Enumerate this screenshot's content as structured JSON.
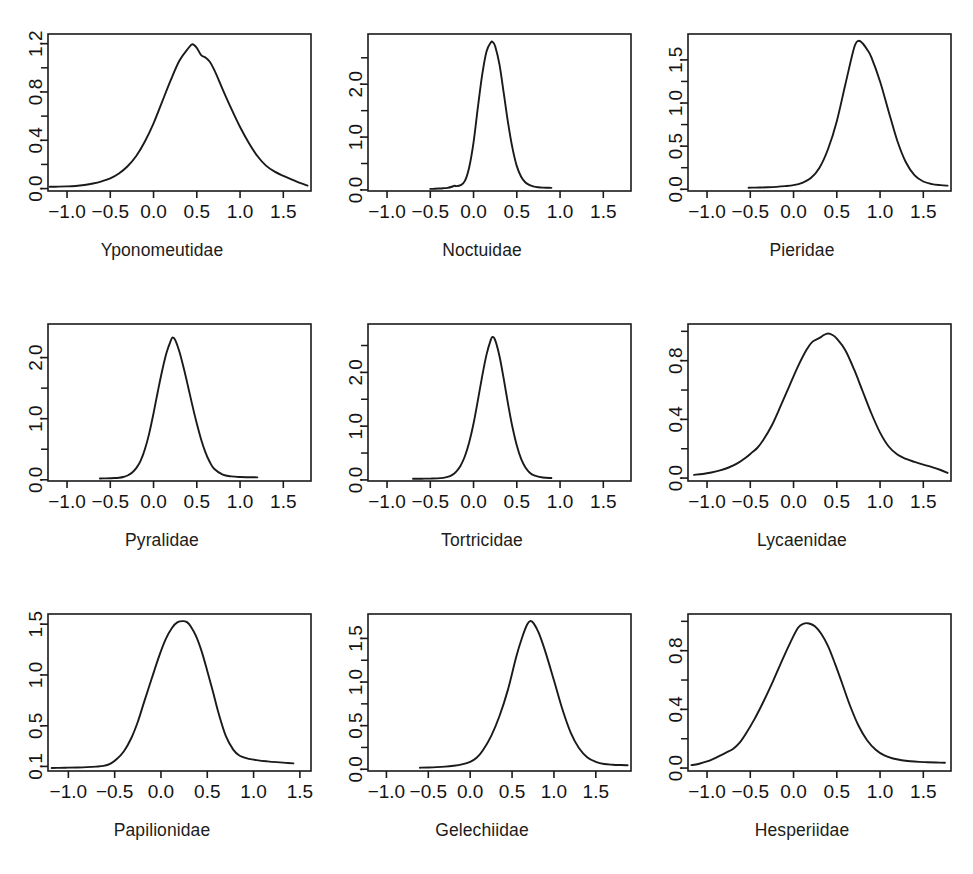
{
  "figure": {
    "background": "#ffffff",
    "line_color": "#1a1a1a",
    "axis_color": "#1a1a1a",
    "rows": 3,
    "cols": 3,
    "top_clipped_text": "·                                 ·"
  },
  "chart_data": [
    {
      "type": "line",
      "title": "Yponomeutidae",
      "xlabel": "",
      "ylabel": "",
      "xlim": [
        -1.22,
        1.82
      ],
      "ylim": [
        -0.02,
        1.28
      ],
      "xticks": [
        -1.0,
        -0.5,
        0.0,
        0.5,
        1.0,
        1.5
      ],
      "xticklabels": [
        "-1.0",
        "-0.5",
        "0.0",
        "0.5",
        "1.0",
        "1.5"
      ],
      "yticks": [
        0.0,
        0.4,
        0.8,
        1.2
      ],
      "yticklabels": [
        "0.0",
        "0.4",
        "0.8",
        "1.2"
      ],
      "yminor": [
        0.2,
        0.6,
        1.0
      ],
      "grid": false,
      "x": [
        -1.2,
        -1.1,
        -1.0,
        -0.9,
        -0.8,
        -0.7,
        -0.6,
        -0.5,
        -0.4,
        -0.3,
        -0.2,
        -0.1,
        0.0,
        0.1,
        0.2,
        0.3,
        0.4,
        0.45,
        0.5,
        0.55,
        0.6,
        0.65,
        0.7,
        0.75,
        0.8,
        0.9,
        1.0,
        1.1,
        1.2,
        1.3,
        1.4,
        1.5,
        1.6,
        1.7,
        1.78
      ],
      "y": [
        0.015,
        0.016,
        0.018,
        0.022,
        0.03,
        0.042,
        0.06,
        0.085,
        0.125,
        0.185,
        0.27,
        0.39,
        0.54,
        0.72,
        0.9,
        1.06,
        1.16,
        1.195,
        1.165,
        1.105,
        1.085,
        1.05,
        0.985,
        0.905,
        0.82,
        0.66,
        0.51,
        0.38,
        0.27,
        0.19,
        0.14,
        0.105,
        0.075,
        0.045,
        0.025
      ]
    },
    {
      "type": "line",
      "title": "Noctuidae",
      "xlabel": "",
      "ylabel": "",
      "xlim": [
        -1.22,
        1.82
      ],
      "ylim": [
        -0.02,
        2.95
      ],
      "xticks": [
        -1.0,
        -0.5,
        0.0,
        0.5,
        1.0,
        1.5
      ],
      "xticklabels": [
        "-1.0",
        "-0.5",
        "0.0",
        "0.5",
        "1.0",
        "1.5"
      ],
      "yticks": [
        0.0,
        1.0,
        2.0
      ],
      "yticklabels": [
        "0.0",
        "1.0",
        "2.0"
      ],
      "yminor": [
        0.5,
        1.5,
        2.5
      ],
      "grid": false,
      "x": [
        -0.5,
        -0.45,
        -0.4,
        -0.35,
        -0.3,
        -0.25,
        -0.22,
        -0.2,
        -0.15,
        -0.1,
        -0.05,
        0.0,
        0.05,
        0.1,
        0.15,
        0.2,
        0.22,
        0.25,
        0.3,
        0.35,
        0.4,
        0.45,
        0.5,
        0.55,
        0.6,
        0.65,
        0.7,
        0.75,
        0.8,
        0.85,
        0.9
      ],
      "y": [
        0.02,
        0.022,
        0.026,
        0.032,
        0.04,
        0.06,
        0.08,
        0.072,
        0.09,
        0.17,
        0.43,
        0.9,
        1.56,
        2.18,
        2.62,
        2.79,
        2.8,
        2.72,
        2.37,
        1.82,
        1.26,
        0.79,
        0.45,
        0.25,
        0.14,
        0.09,
        0.062,
        0.05,
        0.044,
        0.042,
        0.04
      ]
    },
    {
      "type": "line",
      "title": "Pieridae",
      "xlabel": "",
      "ylabel": "",
      "xlim": [
        -1.22,
        1.82
      ],
      "ylim": [
        -0.02,
        1.8
      ],
      "xticks": [
        -1.0,
        -0.5,
        0.0,
        0.5,
        1.0,
        1.5
      ],
      "xticklabels": [
        "-1.0",
        "-0.5",
        "0.0",
        "0.5",
        "1.0",
        "1.5"
      ],
      "yticks": [
        0.0,
        0.5,
        1.0,
        1.5
      ],
      "yticklabels": [
        "0.0",
        "0.5",
        "1.0",
        "1.5"
      ],
      "yminor": [
        0.25,
        0.75,
        1.25
      ],
      "grid": false,
      "x": [
        -0.52,
        -0.45,
        -0.4,
        -0.3,
        -0.2,
        -0.1,
        0.0,
        0.1,
        0.2,
        0.3,
        0.4,
        0.5,
        0.6,
        0.7,
        0.75,
        0.8,
        0.85,
        0.9,
        1.0,
        1.1,
        1.2,
        1.3,
        1.4,
        1.5,
        1.6,
        1.7,
        1.78
      ],
      "y": [
        0.018,
        0.019,
        0.02,
        0.023,
        0.028,
        0.036,
        0.048,
        0.075,
        0.13,
        0.25,
        0.47,
        0.79,
        1.22,
        1.64,
        1.72,
        1.69,
        1.62,
        1.53,
        1.25,
        0.9,
        0.56,
        0.31,
        0.16,
        0.09,
        0.06,
        0.048,
        0.042
      ]
    },
    {
      "type": "line",
      "title": "Pyralidae",
      "xlabel": "",
      "ylabel": "",
      "xlim": [
        -1.22,
        1.82
      ],
      "ylim": [
        -0.02,
        2.55
      ],
      "xticks": [
        -1.0,
        -0.5,
        0.0,
        0.5,
        1.0,
        1.5
      ],
      "xticklabels": [
        "-1.0",
        "-0.5",
        "0.0",
        "0.5",
        "1.0",
        "1.5"
      ],
      "yticks": [
        0.0,
        1.0,
        2.0
      ],
      "yticklabels": [
        "0.0",
        "1.0",
        "2.0"
      ],
      "yminor": [
        0.5,
        1.5
      ],
      "grid": false,
      "x": [
        -0.62,
        -0.55,
        -0.5,
        -0.45,
        -0.4,
        -0.35,
        -0.3,
        -0.25,
        -0.2,
        -0.15,
        -0.1,
        -0.05,
        0.0,
        0.05,
        0.1,
        0.15,
        0.2,
        0.22,
        0.25,
        0.3,
        0.35,
        0.4,
        0.45,
        0.5,
        0.55,
        0.6,
        0.65,
        0.7,
        0.8,
        0.9,
        1.0,
        1.1,
        1.2
      ],
      "y": [
        0.022,
        0.023,
        0.025,
        0.028,
        0.034,
        0.046,
        0.07,
        0.115,
        0.19,
        0.31,
        0.5,
        0.76,
        1.09,
        1.45,
        1.79,
        2.08,
        2.28,
        2.33,
        2.29,
        2.09,
        1.82,
        1.52,
        1.21,
        0.92,
        0.66,
        0.45,
        0.29,
        0.18,
        0.085,
        0.055,
        0.045,
        0.042,
        0.04
      ]
    },
    {
      "type": "line",
      "title": "Tortricidae",
      "xlabel": "",
      "ylabel": "",
      "xlim": [
        -1.22,
        1.82
      ],
      "ylim": [
        -0.02,
        2.9
      ],
      "xticks": [
        -1.0,
        -0.5,
        0.0,
        0.5,
        1.0,
        1.5
      ],
      "xticklabels": [
        "-1.0",
        "-0.5",
        "0.0",
        "0.5",
        "1.0",
        "1.5"
      ],
      "yticks": [
        0.0,
        1.0,
        2.0
      ],
      "yticklabels": [
        "0.0",
        "1.0",
        "2.0"
      ],
      "yminor": [
        0.5,
        1.5,
        2.5
      ],
      "grid": false,
      "x": [
        -0.7,
        -0.6,
        -0.5,
        -0.42,
        -0.35,
        -0.3,
        -0.25,
        -0.2,
        -0.15,
        -0.1,
        -0.05,
        0.0,
        0.05,
        0.1,
        0.15,
        0.2,
        0.22,
        0.25,
        0.3,
        0.35,
        0.4,
        0.45,
        0.5,
        0.55,
        0.6,
        0.65,
        0.7,
        0.8,
        0.9
      ],
      "y": [
        0.022,
        0.023,
        0.025,
        0.028,
        0.038,
        0.055,
        0.09,
        0.155,
        0.265,
        0.44,
        0.7,
        1.05,
        1.48,
        1.93,
        2.33,
        2.61,
        2.66,
        2.6,
        2.3,
        1.87,
        1.4,
        0.98,
        0.64,
        0.39,
        0.23,
        0.135,
        0.085,
        0.045,
        0.035
      ]
    },
    {
      "type": "line",
      "title": "Lycaenidae",
      "xlabel": "",
      "ylabel": "",
      "xlim": [
        -1.22,
        1.82
      ],
      "ylim": [
        -0.02,
        1.05
      ],
      "xticks": [
        -1.0,
        -0.5,
        0.0,
        0.5,
        1.0,
        1.5
      ],
      "xticklabels": [
        "-1.0",
        "-0.5",
        "0.0",
        "0.5",
        "1.0",
        "1.5"
      ],
      "yticks": [
        0.0,
        0.4,
        0.8
      ],
      "yticklabels": [
        "0.0",
        "0.4",
        "0.8"
      ],
      "yminor": [
        0.2,
        0.6,
        1.0
      ],
      "grid": false,
      "x": [
        -1.15,
        -1.05,
        -0.95,
        -0.85,
        -0.75,
        -0.65,
        -0.55,
        -0.48,
        -0.42,
        -0.35,
        -0.25,
        -0.15,
        -0.05,
        0.05,
        0.15,
        0.22,
        0.3,
        0.35,
        0.4,
        0.45,
        0.5,
        0.6,
        0.7,
        0.8,
        0.9,
        1.0,
        1.1,
        1.2,
        1.3,
        1.4,
        1.5,
        1.6,
        1.7,
        1.78
      ],
      "y": [
        0.022,
        0.028,
        0.038,
        0.052,
        0.072,
        0.1,
        0.14,
        0.175,
        0.205,
        0.26,
        0.36,
        0.49,
        0.625,
        0.76,
        0.875,
        0.93,
        0.955,
        0.975,
        0.985,
        0.975,
        0.95,
        0.87,
        0.74,
        0.59,
        0.44,
        0.31,
        0.215,
        0.16,
        0.13,
        0.11,
        0.092,
        0.075,
        0.055,
        0.035
      ]
    },
    {
      "type": "line",
      "title": "Papilionidae",
      "xlabel": "",
      "ylabel": "",
      "xlim": [
        -1.22,
        1.62
      ],
      "ylim": [
        0.055,
        1.6
      ],
      "xticks": [
        -1.0,
        -0.5,
        0.0,
        0.5,
        1.0,
        1.5
      ],
      "xticklabels": [
        "-1.0",
        "-0.5",
        "0.0",
        "0.5",
        "1.0",
        "1.5"
      ],
      "yticks": [
        0.1,
        0.5,
        1.0,
        1.5
      ],
      "yticklabels": [
        "0.1",
        "0.5",
        "1.0",
        "1.5"
      ],
      "yminor": [],
      "grid": false,
      "x": [
        -1.18,
        -1.1,
        -1.0,
        -0.9,
        -0.8,
        -0.7,
        -0.62,
        -0.55,
        -0.48,
        -0.4,
        -0.32,
        -0.25,
        -0.18,
        -0.1,
        -0.02,
        0.05,
        0.12,
        0.18,
        0.24,
        0.28,
        0.32,
        0.38,
        0.44,
        0.5,
        0.56,
        0.62,
        0.7,
        0.78,
        0.85,
        0.95,
        1.05,
        1.15,
        1.25,
        1.35,
        1.43
      ],
      "y": [
        0.085,
        0.086,
        0.088,
        0.09,
        0.093,
        0.098,
        0.105,
        0.125,
        0.17,
        0.25,
        0.38,
        0.54,
        0.74,
        0.965,
        1.185,
        1.35,
        1.465,
        1.52,
        1.53,
        1.52,
        1.48,
        1.38,
        1.23,
        1.04,
        0.84,
        0.63,
        0.4,
        0.265,
        0.205,
        0.175,
        0.16,
        0.15,
        0.142,
        0.135,
        0.13
      ]
    },
    {
      "type": "line",
      "title": "Gelechiidae",
      "xlabel": "",
      "ylabel": "",
      "xlim": [
        -1.22,
        1.92
      ],
      "ylim": [
        -0.02,
        1.78
      ],
      "xticks": [
        -1.0,
        -0.5,
        0.0,
        0.5,
        1.0,
        1.5
      ],
      "xticklabels": [
        "-1.0",
        "-0.5",
        "0.0",
        "0.5",
        "1.0",
        "1.5"
      ],
      "yticks": [
        0.0,
        0.5,
        1.0,
        1.5
      ],
      "yticklabels": [
        "0.0",
        "0.5",
        "1.0",
        "1.5"
      ],
      "yminor": [
        0.25,
        0.75,
        1.25
      ],
      "grid": false,
      "x": [
        -0.6,
        -0.5,
        -0.4,
        -0.3,
        -0.2,
        -0.1,
        0.0,
        0.08,
        0.15,
        0.25,
        0.35,
        0.45,
        0.55,
        0.62,
        0.68,
        0.72,
        0.76,
        0.82,
        0.9,
        1.0,
        1.1,
        1.2,
        1.3,
        1.4,
        1.5,
        1.6,
        1.7,
        1.8,
        1.88
      ],
      "y": [
        0.018,
        0.02,
        0.024,
        0.03,
        0.04,
        0.056,
        0.085,
        0.135,
        0.215,
        0.38,
        0.61,
        0.91,
        1.29,
        1.51,
        1.66,
        1.7,
        1.67,
        1.56,
        1.34,
        1.02,
        0.69,
        0.42,
        0.24,
        0.135,
        0.085,
        0.06,
        0.052,
        0.048,
        0.046
      ]
    },
    {
      "type": "line",
      "title": "Hesperiidae",
      "xlabel": "",
      "ylabel": "",
      "xlim": [
        -1.22,
        1.82
      ],
      "ylim": [
        -0.02,
        1.05
      ],
      "xticks": [
        -1.0,
        -0.5,
        0.0,
        0.5,
        1.0,
        1.5
      ],
      "xticklabels": [
        "-1.0",
        "-0.5",
        "0.0",
        "0.5",
        "1.0",
        "1.5"
      ],
      "yticks": [
        0.0,
        0.4,
        0.8
      ],
      "yticklabels": [
        "0.0",
        "0.4",
        "0.8"
      ],
      "yminor": [
        0.2,
        0.6,
        1.0
      ],
      "grid": false,
      "x": [
        -1.18,
        -1.1,
        -1.0,
        -0.92,
        -0.85,
        -0.78,
        -0.7,
        -0.62,
        -0.55,
        -0.45,
        -0.35,
        -0.25,
        -0.15,
        -0.05,
        0.05,
        0.12,
        0.18,
        0.25,
        0.32,
        0.4,
        0.48,
        0.56,
        0.65,
        0.75,
        0.85,
        0.95,
        1.05,
        1.15,
        1.25,
        1.35,
        1.45,
        1.55,
        1.65,
        1.75
      ],
      "y": [
        0.02,
        0.028,
        0.045,
        0.065,
        0.085,
        0.105,
        0.13,
        0.175,
        0.235,
        0.335,
        0.45,
        0.575,
        0.71,
        0.84,
        0.955,
        0.985,
        0.985,
        0.965,
        0.915,
        0.83,
        0.71,
        0.58,
        0.43,
        0.29,
        0.19,
        0.125,
        0.086,
        0.065,
        0.053,
        0.046,
        0.042,
        0.04,
        0.038,
        0.036
      ]
    }
  ]
}
